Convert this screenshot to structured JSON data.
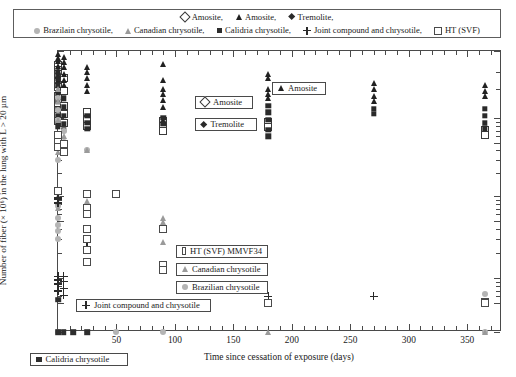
{
  "legend": {
    "row1": [
      {
        "marker": "open-diamond",
        "label": "Amosite,"
      },
      {
        "marker": "filled-tri",
        "label": "Amosite,"
      },
      {
        "marker": "filled-diamond",
        "label": "Tremolite,"
      }
    ],
    "row2": [
      {
        "marker": "grey-circle",
        "label": "Brazilain chrysotile,"
      },
      {
        "marker": "grey-tri",
        "label": "Canadian chrysotile,"
      },
      {
        "marker": "filled-sq",
        "label": "Calidria chrysotile,"
      },
      {
        "marker": "plus",
        "label": "Joint compound and chrysotile,"
      },
      {
        "marker": "open-sq",
        "label": "HT (SVF)"
      }
    ]
  },
  "callouts": [
    {
      "name": "amosite-open",
      "marker": "open-diamond",
      "label": "Amosite",
      "x": 195,
      "y": 96,
      "w": 58
    },
    {
      "name": "tremolite",
      "marker": "filled-diamond",
      "label": "Tremolite",
      "x": 195,
      "y": 118,
      "w": 62
    },
    {
      "name": "amosite-filled",
      "marker": "filled-tri",
      "label": "Amosite",
      "x": 272,
      "y": 82,
      "w": 54
    },
    {
      "name": "ht-svf-mmvf34",
      "marker": "open-sq",
      "label": "HT (SVF) MMVF34",
      "x": 176,
      "y": 245,
      "w": 92
    },
    {
      "name": "canadian-chrysotile",
      "marker": "grey-tri",
      "label": "Canadian chrysotile",
      "x": 176,
      "y": 263,
      "w": 92
    },
    {
      "name": "brazilian-chrysotile",
      "marker": "grey-circle",
      "label": "Brazilian chrysotile",
      "x": 176,
      "y": 281,
      "w": 92
    },
    {
      "name": "joint-compound",
      "marker": "plus",
      "label": "Joint compound and chrysotile",
      "x": 76,
      "y": 299,
      "w": 135
    },
    {
      "name": "calidria-chrysotile",
      "marker": "filled-sq",
      "label": "Calidria chrysotile",
      "x": 30,
      "y": 353,
      "w": 98
    }
  ],
  "chart_data": {
    "type": "scatter",
    "title": "",
    "xlabel": "Time since cessation of exposure (days)",
    "ylabel": "Number of fiber (× 10⁶) in the lung with L > 20 µm",
    "xlim": [
      0,
      378
    ],
    "ylim_labels": [
      "5.0",
      "1.0",
      "0.5",
      "0.1",
      "0.05",
      "0.01",
      "0.005",
      "0"
    ],
    "yscale": "log-with-zero-break",
    "xticks": [
      50,
      100,
      150,
      200,
      250,
      300,
      350
    ],
    "xticks_minor": [
      10,
      20,
      30,
      40,
      60,
      70,
      80,
      90,
      110,
      120,
      130,
      140,
      160,
      170,
      180,
      190,
      210,
      220,
      230,
      240,
      260,
      270,
      280,
      290,
      310,
      320,
      330,
      340,
      360,
      370
    ],
    "grid": false,
    "legend_position": "top-outside",
    "series": [
      {
        "name": "Amosite (open diamond)",
        "marker": "open-diamond",
        "points": [
          [
            0,
            3.6
          ],
          [
            0,
            3.2
          ],
          [
            0,
            2.9
          ],
          [
            0,
            2.4
          ],
          [
            0,
            2.1
          ],
          [
            0,
            1.7
          ],
          [
            0,
            1.45
          ],
          [
            0,
            1.2
          ],
          [
            0,
            1.05
          ],
          [
            0,
            0.92
          ],
          [
            5,
            2.6
          ],
          [
            5,
            1.9
          ],
          [
            5,
            1.35
          ],
          [
            5,
            1.1
          ],
          [
            5,
            0.88
          ],
          [
            25,
            1.15
          ],
          [
            25,
            0.95
          ],
          [
            25,
            0.8
          ],
          [
            90,
            0.92
          ],
          [
            90,
            0.8
          ],
          [
            90,
            0.7
          ],
          [
            180,
            0.9
          ],
          [
            180,
            0.78
          ],
          [
            365,
            0.72
          ],
          [
            365,
            0.62
          ]
        ]
      },
      {
        "name": "Amosite (filled triangle)",
        "marker": "filled-tri",
        "points": [
          [
            0,
            4.6
          ],
          [
            0,
            4.2
          ],
          [
            0,
            3.9
          ],
          [
            0,
            3.5
          ],
          [
            0,
            3.1
          ],
          [
            0,
            2.8
          ],
          [
            0,
            2.5
          ],
          [
            0,
            2.2
          ],
          [
            0,
            1.95
          ],
          [
            0,
            1.7
          ],
          [
            5,
            4.3
          ],
          [
            5,
            3.8
          ],
          [
            5,
            3.4
          ],
          [
            5,
            2.9
          ],
          [
            5,
            2.5
          ],
          [
            5,
            2.2
          ],
          [
            25,
            3.4
          ],
          [
            25,
            3.0
          ],
          [
            25,
            2.6
          ],
          [
            25,
            2.2
          ],
          [
            25,
            1.9
          ],
          [
            90,
            3.7
          ],
          [
            90,
            2.5
          ],
          [
            90,
            2.0
          ],
          [
            90,
            1.8
          ],
          [
            90,
            1.55
          ],
          [
            90,
            1.3
          ],
          [
            90,
            0.95
          ],
          [
            180,
            2.9
          ],
          [
            180,
            2.6
          ],
          [
            180,
            2.0
          ],
          [
            180,
            1.8
          ],
          [
            180,
            1.6
          ],
          [
            270,
            2.3
          ],
          [
            270,
            2.0
          ],
          [
            270,
            1.7
          ],
          [
            270,
            1.5
          ],
          [
            365,
            2.2
          ],
          [
            365,
            1.9
          ],
          [
            365,
            1.7
          ]
        ]
      },
      {
        "name": "Tremolite",
        "marker": "filled-diamond",
        "points": [
          [
            0,
            3.0
          ],
          [
            0,
            2.6
          ],
          [
            0,
            2.2
          ],
          [
            0,
            1.8
          ],
          [
            0,
            1.5
          ],
          [
            0,
            1.25
          ],
          [
            0,
            1.05
          ],
          [
            0,
            0.9
          ],
          [
            0,
            0.78
          ],
          [
            5,
            1.6
          ],
          [
            5,
            1.3
          ],
          [
            5,
            1.05
          ],
          [
            5,
            0.85
          ],
          [
            5,
            0.72
          ],
          [
            5,
            0.4
          ],
          [
            25,
            1.05
          ],
          [
            25,
            0.88
          ],
          [
            25,
            0.74
          ],
          [
            90,
            1.0
          ],
          [
            90,
            0.85
          ],
          [
            180,
            1.35
          ],
          [
            180,
            1.15
          ],
          [
            180,
            0.95
          ],
          [
            180,
            0.72
          ],
          [
            180,
            0.6
          ],
          [
            270,
            1.25
          ],
          [
            270,
            1.1
          ],
          [
            365,
            1.25
          ],
          [
            365,
            1.05
          ],
          [
            365,
            0.88
          ],
          [
            365,
            0.75
          ]
        ]
      },
      {
        "name": "Brazilain chrysotile",
        "marker": "grey-circle",
        "points": [
          [
            0,
            1.6
          ],
          [
            0,
            1.2
          ],
          [
            0,
            0.95
          ],
          [
            0,
            0.62
          ],
          [
            0,
            0.3
          ],
          [
            0,
            0.075
          ],
          [
            0,
            0.055
          ],
          [
            0,
            0.045
          ],
          [
            0,
            0.038
          ],
          [
            0,
            0.03
          ],
          [
            0,
            0.0
          ],
          [
            5,
            0.7
          ],
          [
            5,
            0.52
          ],
          [
            25,
            0.4
          ],
          [
            50,
            0.0
          ],
          [
            90,
            0.0
          ],
          [
            365,
            0.0065
          ],
          [
            365,
            0.0
          ]
        ]
      },
      {
        "name": "Canadian chrysotile",
        "marker": "grey-tri",
        "points": [
          [
            0,
            2.0
          ],
          [
            0,
            1.5
          ],
          [
            0,
            0.95
          ],
          [
            0,
            0.62
          ],
          [
            0,
            0.5
          ],
          [
            0,
            0.44
          ],
          [
            0,
            0.38
          ],
          [
            0,
            0.115
          ],
          [
            0,
            0.1
          ],
          [
            0,
            0.085
          ],
          [
            0,
            0.072
          ],
          [
            5,
            0.6
          ],
          [
            5,
            0.47
          ],
          [
            5,
            0.42
          ],
          [
            25,
            0.4
          ],
          [
            25,
            0.088
          ],
          [
            25,
            0.072
          ],
          [
            25,
            0.06
          ],
          [
            90,
            0.055
          ],
          [
            90,
            0.048
          ],
          [
            90,
            0.042
          ],
          [
            90,
            0.028
          ],
          [
            180,
            0.0
          ],
          [
            365,
            0.0
          ]
        ]
      },
      {
        "name": "Calidria chrysotile",
        "marker": "filled-sq",
        "points": [
          [
            0,
            0.0055
          ],
          [
            0,
            0.0
          ],
          [
            5,
            0.0
          ],
          [
            13,
            0.0
          ],
          [
            25,
            0.0
          ]
        ]
      },
      {
        "name": "Joint compound and chrysotile",
        "marker": "plus",
        "points": [
          [
            0,
            0.115
          ],
          [
            0,
            0.105
          ],
          [
            0,
            0.095
          ],
          [
            0,
            0.09
          ],
          [
            0,
            0.082
          ],
          [
            0,
            0.0105
          ],
          [
            0,
            0.0095
          ],
          [
            0,
            0.0085
          ],
          [
            0,
            0.007
          ],
          [
            5,
            0.0105
          ],
          [
            5,
            0.009
          ],
          [
            5,
            0.0075
          ],
          [
            5,
            0.0062
          ],
          [
            25,
            0.024
          ],
          [
            180,
            0.006
          ],
          [
            270,
            0.006
          ]
        ]
      },
      {
        "name": "HT (SVF)",
        "marker": "open-sq",
        "points": [
          [
            0,
            0.62
          ],
          [
            0,
            0.52
          ],
          [
            0,
            0.44
          ],
          [
            0,
            0.115
          ],
          [
            5,
            0.48
          ],
          [
            5,
            0.38
          ],
          [
            25,
            0.105
          ],
          [
            25,
            0.072
          ],
          [
            25,
            0.06
          ],
          [
            25,
            0.04
          ],
          [
            25,
            0.03
          ],
          [
            25,
            0.022
          ],
          [
            25,
            0.0155
          ],
          [
            50,
            0.105
          ],
          [
            90,
            0.04
          ],
          [
            90,
            0.0145
          ],
          [
            90,
            0.0125
          ],
          [
            180,
            0.0048
          ],
          [
            365,
            0.0052
          ],
          [
            365,
            0.0042
          ]
        ]
      }
    ]
  }
}
